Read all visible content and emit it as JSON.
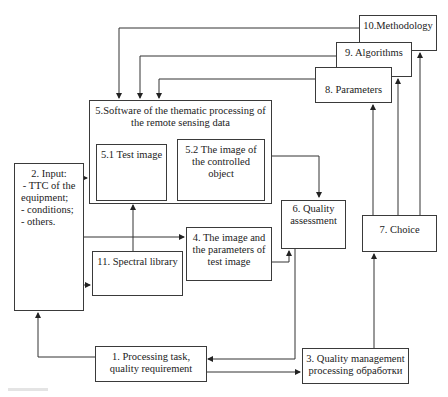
{
  "diagram": {
    "nodes": {
      "n1": {
        "label": "1. Processing task,\nquality requirement"
      },
      "n2": {
        "title": "2. Input:",
        "items": [
          "- TTC of the",
          "equipment;",
          "- conditions;",
          "- others."
        ]
      },
      "n3": {
        "label": "3. Quality management\nprocessing  обработки"
      },
      "n4": {
        "label": "4. The image and\nthe parameters of\ntest image"
      },
      "n5": {
        "label": "5.Software of the thematic processing of\nthe remote sensing data"
      },
      "n51": {
        "label": "5.1 Test image"
      },
      "n52": {
        "label": "5.2 The image of\nthe controlled\nobject"
      },
      "n6": {
        "label": "6. Quality\nassessment"
      },
      "n7": {
        "label": "7. Choice"
      },
      "n8": {
        "label": "8. Parameters"
      },
      "n9": {
        "label": "9. Algorithms"
      },
      "n10": {
        "label": "10.Methodology"
      },
      "n11": {
        "label": "11. Spectral library"
      }
    },
    "edges": [
      {
        "from": "10",
        "to": "5"
      },
      {
        "from": "9",
        "to": "5"
      },
      {
        "from": "8",
        "to": "5"
      },
      {
        "from": "7",
        "to": "8"
      },
      {
        "from": "7",
        "to": "9"
      },
      {
        "from": "7",
        "to": "10"
      },
      {
        "from": "5.2",
        "to": "6"
      },
      {
        "from": "4",
        "to": "6"
      },
      {
        "from": "2",
        "to": "5"
      },
      {
        "from": "2",
        "to": "4"
      },
      {
        "from": "2",
        "to": "11"
      },
      {
        "from": "11",
        "to": "5"
      },
      {
        "from": "1",
        "to": "2"
      },
      {
        "from": "1",
        "to": "3"
      },
      {
        "from": "6",
        "to": "1"
      },
      {
        "from": "3",
        "to": "7"
      }
    ],
    "caption": "Fig."
  }
}
